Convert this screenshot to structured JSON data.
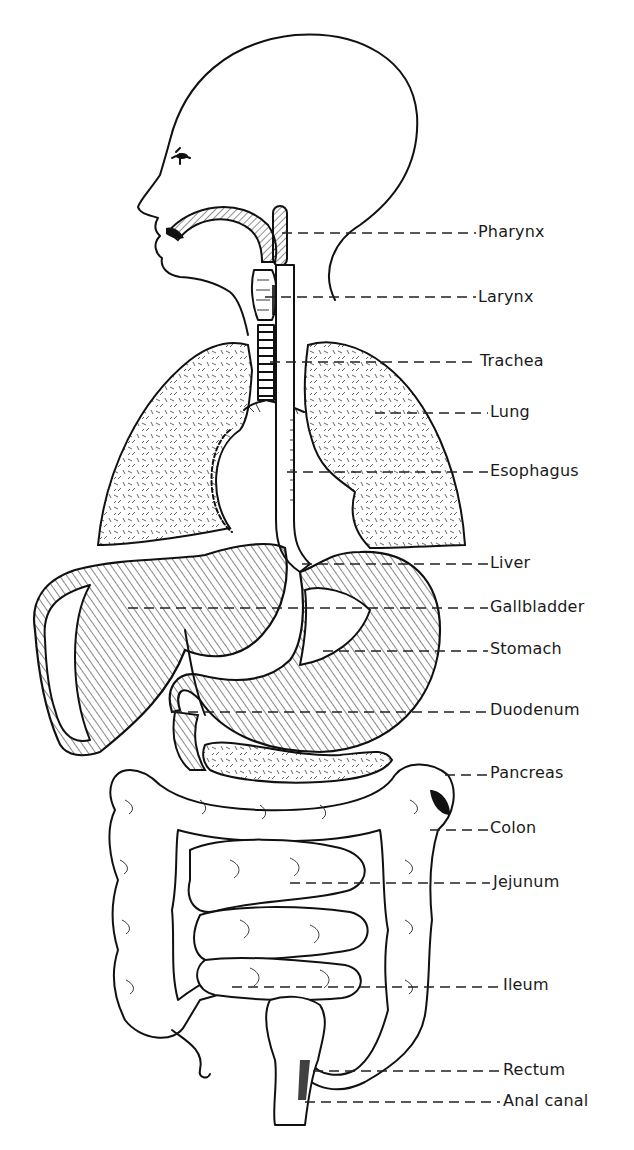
{
  "diagram": {
    "labels": [
      {
        "id": "pharynx",
        "text": "Pharynx",
        "x": 478,
        "y": 222,
        "line_from": 282,
        "line_y": 233
      },
      {
        "id": "larynx",
        "text": "Larynx",
        "x": 478,
        "y": 287,
        "line_from": 265,
        "line_y": 297
      },
      {
        "id": "trachea",
        "text": "Trachea",
        "x": 480,
        "y": 350,
        "line_from": 270,
        "line_y": 362
      },
      {
        "id": "lung",
        "text": "Lung",
        "x": 490,
        "y": 402,
        "line_from": 375,
        "line_y": 413
      },
      {
        "id": "esophagus",
        "text": "Esophagus",
        "x": 490,
        "y": 459,
        "line_from": 287,
        "line_y": 472
      },
      {
        "id": "liver",
        "text": "Liver",
        "x": 490,
        "y": 552,
        "line_from": 302,
        "line_y": 564
      },
      {
        "id": "gallbladder",
        "text": "Gallbladder",
        "x": 490,
        "y": 595,
        "line_from": 128,
        "line_y": 608
      },
      {
        "id": "stomach",
        "text": "Stomach",
        "x": 490,
        "y": 637,
        "line_from": 323,
        "line_y": 651
      },
      {
        "id": "duodenum",
        "text": "Duodenum",
        "x": 490,
        "y": 699,
        "line_from": 172,
        "line_y": 712
      },
      {
        "id": "pancreas",
        "text": "Pancreas",
        "x": 490,
        "y": 762,
        "line_from": 445,
        "line_y": 775
      },
      {
        "id": "colon",
        "text": "Colon",
        "x": 490,
        "y": 818,
        "line_from": 430,
        "line_y": 830
      },
      {
        "id": "jejunum",
        "text": "Jejunum",
        "x": 493,
        "y": 871,
        "line_from": 290,
        "line_y": 883
      },
      {
        "id": "ileum",
        "text": "Ileum",
        "x": 503,
        "y": 974,
        "line_from": 232,
        "line_y": 987
      },
      {
        "id": "rectum",
        "text": "Rectum",
        "x": 503,
        "y": 1059,
        "line_from": 313,
        "line_y": 1071
      },
      {
        "id": "anal_canal",
        "text": "Anal canal",
        "x": 503,
        "y": 1091,
        "line_from": 305,
        "line_y": 1102
      }
    ]
  }
}
